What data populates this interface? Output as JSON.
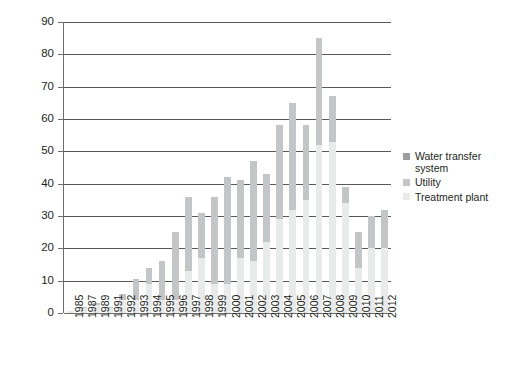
{
  "chart_data": {
    "type": "bar",
    "subtype": "stacked-bar",
    "title": "",
    "subtitle": "",
    "xlabel": "",
    "ylabel": "",
    "ylim": [
      0,
      90
    ],
    "ytick_step": 10,
    "yticks": [
      0,
      10,
      20,
      30,
      40,
      50,
      60,
      70,
      80,
      90
    ],
    "grid": true,
    "grid_axis": "y",
    "legend_position": "right",
    "categories": [
      "1985",
      "1987",
      "1989",
      "1991",
      "1992",
      "1993",
      "1994",
      "1995",
      "1996",
      "1997",
      "1998",
      "1999",
      "2000",
      "2001",
      "2002",
      "2003",
      "2004",
      "2005",
      "2006",
      "2007",
      "2008",
      "2009",
      "2010",
      "2011",
      "2012"
    ],
    "series": [
      {
        "name": "Treatment plant",
        "color": "#e9eaea",
        "values": [
          0.5,
          1.5,
          2.5,
          1.5,
          4,
          4,
          9,
          4,
          4,
          13,
          17,
          9,
          9,
          17,
          16,
          22,
          29,
          32,
          35,
          52,
          53,
          34,
          14,
          20,
          20
        ]
      },
      {
        "name": "Utility",
        "color": "#c3c5c6",
        "values": [
          0,
          0.5,
          0.5,
          0.5,
          2,
          6.5,
          5,
          12,
          21,
          23,
          14,
          27,
          33,
          24,
          31,
          21,
          29,
          33,
          23,
          33,
          14,
          5,
          11,
          10,
          12
        ]
      },
      {
        "name": "Water transfer system",
        "color": "#9b9d9f",
        "values": [
          0,
          0,
          0,
          0,
          0,
          0,
          0,
          0,
          0,
          0,
          0,
          0,
          0,
          0,
          0,
          0,
          0,
          0,
          0,
          0,
          0,
          0,
          0,
          0,
          0
        ]
      }
    ],
    "totals": [
      0.5,
      2,
      3,
      2,
      6,
      10.5,
      14,
      16,
      25,
      36,
      31,
      36,
      42,
      41,
      47,
      43,
      58,
      65,
      58,
      85,
      67,
      39,
      25,
      30,
      32
    ],
    "annotations": []
  },
  "legend": {
    "items": [
      {
        "label": "Water transfer system",
        "swatch": "transfer"
      },
      {
        "label": "Utility",
        "swatch": "utility"
      },
      {
        "label": "Treatment plant",
        "swatch": "treatment"
      }
    ]
  },
  "colors": {
    "treatment_plant": "#e9eaea",
    "utility": "#c3c5c6",
    "water_transfer_system": "#9b9d9f",
    "gridline": "#58595b",
    "axis": "#6d6e70",
    "text": "#231f20",
    "background": "#ffffff"
  }
}
